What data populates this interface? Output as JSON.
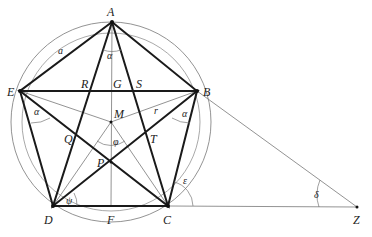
{
  "diagram": {
    "points": {
      "A": {
        "label": "A",
        "x": 112,
        "y": 22
      },
      "B": {
        "label": "B",
        "x": 197,
        "y": 91
      },
      "C": {
        "label": "C",
        "x": 168,
        "y": 206
      },
      "D": {
        "label": "D",
        "x": 53,
        "y": 206
      },
      "E": {
        "label": "E",
        "x": 20,
        "y": 91
      },
      "M": {
        "label": "M",
        "x": 111,
        "y": 122
      },
      "G": {
        "label": "G",
        "x": 111,
        "y": 91
      },
      "R": {
        "label": "R",
        "x": 89,
        "y": 91
      },
      "S": {
        "label": "S",
        "x": 134,
        "y": 91
      },
      "Q": {
        "label": "Q",
        "x": 75,
        "y": 139
      },
      "T": {
        "label": "T",
        "x": 148,
        "y": 139
      },
      "P": {
        "label": "P",
        "x": 111,
        "y": 162
      },
      "F": {
        "label": "F",
        "x": 111,
        "y": 206
      },
      "Z": {
        "label": "Z",
        "x": 357,
        "y": 207
      }
    },
    "angle_labels": {
      "alpha_top": "α",
      "alpha_left": "α",
      "alpha_right": "α",
      "phi_center": "φ",
      "psi_D": "ψ",
      "epsilon_C": "ε",
      "delta_Z": "δ"
    },
    "segment_labels": {
      "side": "a",
      "radius": "r"
    }
  }
}
